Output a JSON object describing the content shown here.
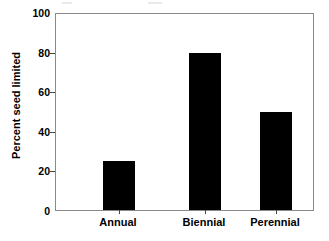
{
  "chart_data": {
    "type": "bar",
    "title": "",
    "subtitle": "",
    "xlabel": "",
    "ylabel": "Percent seed limited",
    "categories": [
      "Annual",
      "Biennial",
      "Perennial"
    ],
    "values": [
      25,
      80,
      50
    ],
    "series": [
      {
        "name": "Percent seed limited",
        "values": [
          25,
          80,
          50
        ]
      }
    ],
    "ylim": [
      0,
      100
    ],
    "yticks": [
      0,
      20,
      40,
      60,
      80,
      100
    ],
    "ytick_labels": [
      "0",
      "20",
      "40",
      "60",
      "80",
      "100"
    ],
    "grid": false,
    "legend": false,
    "legend_position": "none",
    "bar_color": "#000000",
    "frame_color": "#8a8a8a",
    "background": "#ffffff",
    "annotations": []
  }
}
